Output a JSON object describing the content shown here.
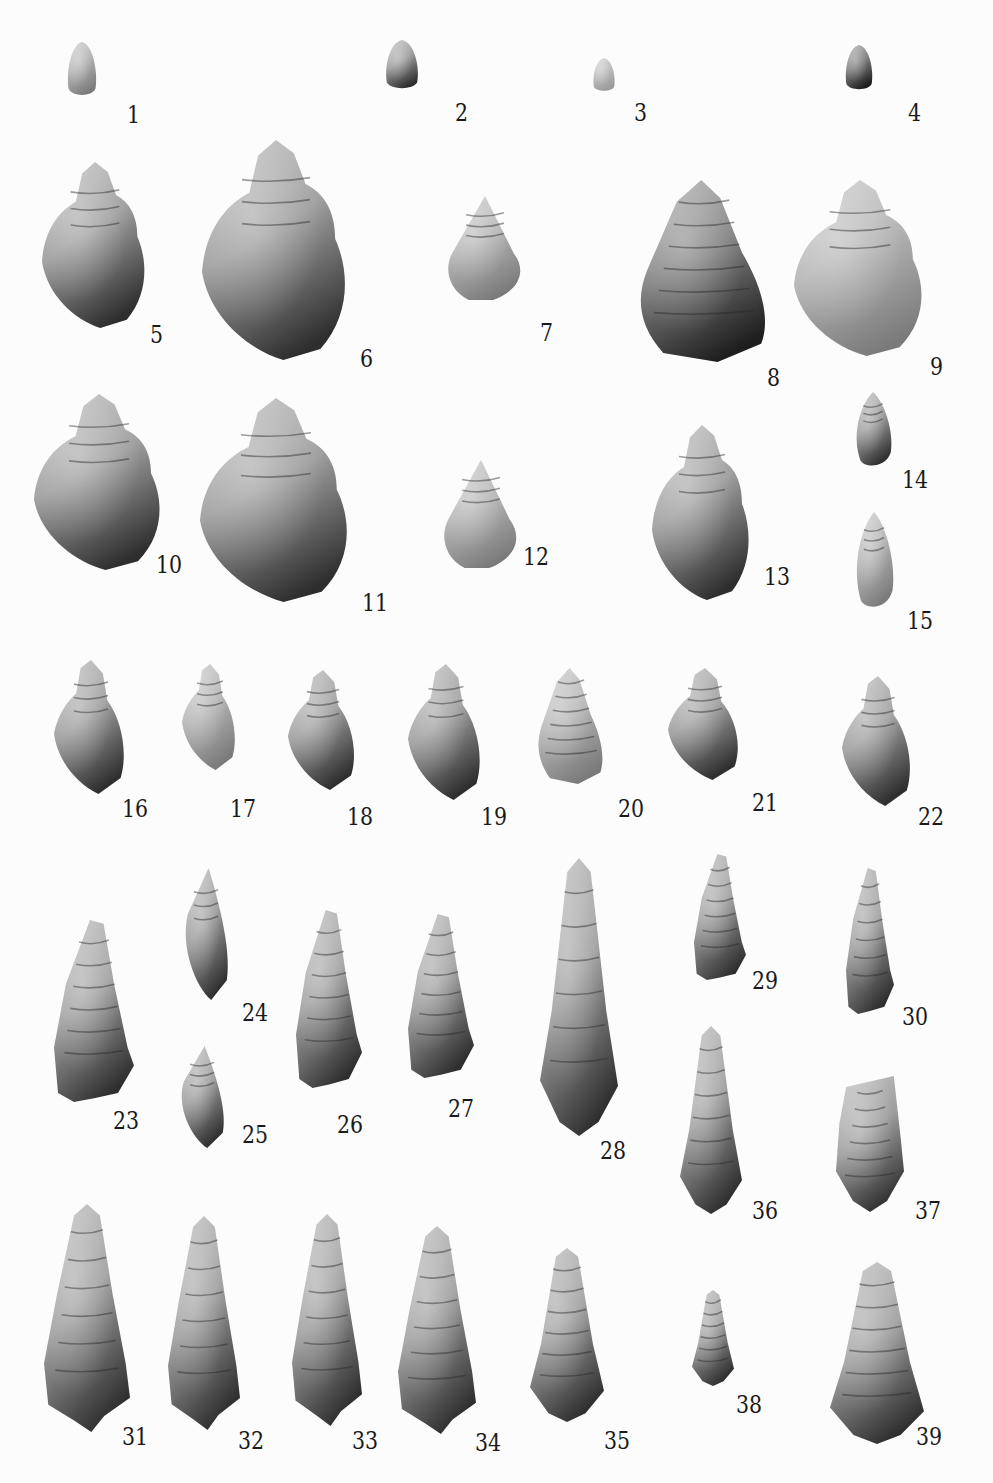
{
  "plate": {
    "background": "#fcfcfc",
    "label_color": "#1a1a1a",
    "figures": [
      {
        "id": "1",
        "label": "1",
        "shape": "egg",
        "x": 66,
        "y": 42,
        "w": 32,
        "h": 55,
        "lx": 127,
        "ly": 102,
        "tone": "light"
      },
      {
        "id": "2",
        "label": "2",
        "shape": "egg",
        "x": 384,
        "y": 40,
        "w": 36,
        "h": 50,
        "lx": 455,
        "ly": 100,
        "tone": "mid"
      },
      {
        "id": "3",
        "label": "3",
        "shape": "egg",
        "x": 592,
        "y": 58,
        "w": 24,
        "h": 34,
        "lx": 634,
        "ly": 100,
        "tone": "pale"
      },
      {
        "id": "4",
        "label": "4",
        "shape": "egg",
        "x": 844,
        "y": 45,
        "w": 30,
        "h": 46,
        "lx": 908,
        "ly": 100,
        "tone": "dark"
      },
      {
        "id": "5",
        "label": "5",
        "shape": "bulbous",
        "x": 42,
        "y": 162,
        "w": 106,
        "h": 166,
        "lx": 150,
        "ly": 322,
        "tone": "mid"
      },
      {
        "id": "6",
        "label": "6",
        "shape": "bulbous",
        "x": 202,
        "y": 140,
        "w": 148,
        "h": 220,
        "lx": 360,
        "ly": 346,
        "tone": "mid"
      },
      {
        "id": "7",
        "label": "7",
        "shape": "trochoid",
        "x": 444,
        "y": 196,
        "w": 82,
        "h": 104,
        "lx": 540,
        "ly": 320,
        "tone": "light"
      },
      {
        "id": "8",
        "label": "8",
        "shape": "conical",
        "x": 636,
        "y": 180,
        "w": 136,
        "h": 182,
        "lx": 767,
        "ly": 365,
        "tone": "dark"
      },
      {
        "id": "9",
        "label": "9",
        "shape": "bulbous",
        "x": 794,
        "y": 180,
        "w": 132,
        "h": 176,
        "lx": 930,
        "ly": 354,
        "tone": "light"
      },
      {
        "id": "10",
        "label": "10",
        "shape": "bulbous",
        "x": 34,
        "y": 394,
        "w": 130,
        "h": 176,
        "lx": 156,
        "ly": 552,
        "tone": "mid"
      },
      {
        "id": "11",
        "label": "11",
        "shape": "bulbous",
        "x": 200,
        "y": 398,
        "w": 152,
        "h": 204,
        "lx": 362,
        "ly": 590,
        "tone": "mid"
      },
      {
        "id": "12",
        "label": "12",
        "shape": "trochoid",
        "x": 440,
        "y": 460,
        "w": 82,
        "h": 108,
        "lx": 523,
        "ly": 544,
        "tone": "light"
      },
      {
        "id": "13",
        "label": "13",
        "shape": "bulbous",
        "x": 652,
        "y": 425,
        "w": 100,
        "h": 175,
        "lx": 764,
        "ly": 564,
        "tone": "mid"
      },
      {
        "id": "14",
        "label": "14",
        "shape": "slender",
        "x": 852,
        "y": 392,
        "w": 42,
        "h": 76,
        "lx": 902,
        "ly": 467,
        "tone": "mid"
      },
      {
        "id": "15",
        "label": "15",
        "shape": "slender",
        "x": 852,
        "y": 512,
        "w": 44,
        "h": 98,
        "lx": 907,
        "ly": 608,
        "tone": "light"
      },
      {
        "id": "16",
        "label": "16",
        "shape": "fusiform",
        "x": 54,
        "y": 660,
        "w": 74,
        "h": 134,
        "lx": 122,
        "ly": 796,
        "tone": "mid"
      },
      {
        "id": "17",
        "label": "17",
        "shape": "fusiform",
        "x": 182,
        "y": 664,
        "w": 56,
        "h": 106,
        "lx": 230,
        "ly": 796,
        "tone": "light"
      },
      {
        "id": "18",
        "label": "18",
        "shape": "fusiform",
        "x": 288,
        "y": 670,
        "w": 70,
        "h": 120,
        "lx": 347,
        "ly": 804,
        "tone": "mid"
      },
      {
        "id": "19",
        "label": "19",
        "shape": "fusiform",
        "x": 408,
        "y": 664,
        "w": 76,
        "h": 136,
        "lx": 481,
        "ly": 804,
        "tone": "mid"
      },
      {
        "id": "20",
        "label": "20",
        "shape": "conical",
        "x": 536,
        "y": 668,
        "w": 70,
        "h": 116,
        "lx": 618,
        "ly": 796,
        "tone": "light"
      },
      {
        "id": "21",
        "label": "21",
        "shape": "fusiform",
        "x": 668,
        "y": 668,
        "w": 74,
        "h": 112,
        "lx": 752,
        "ly": 790,
        "tone": "mid"
      },
      {
        "id": "22",
        "label": "22",
        "shape": "fusiform",
        "x": 842,
        "y": 676,
        "w": 72,
        "h": 130,
        "lx": 918,
        "ly": 804,
        "tone": "mid"
      },
      {
        "id": "23",
        "label": "23",
        "shape": "turritella",
        "x": 54,
        "y": 920,
        "w": 80,
        "h": 182,
        "lx": 113,
        "ly": 1108,
        "tone": "mid"
      },
      {
        "id": "24",
        "label": "24",
        "shape": "spindle",
        "x": 180,
        "y": 868,
        "w": 52,
        "h": 132,
        "lx": 242,
        "ly": 1000,
        "tone": "mid"
      },
      {
        "id": "25",
        "label": "25",
        "shape": "spindle",
        "x": 176,
        "y": 1046,
        "w": 52,
        "h": 102,
        "lx": 242,
        "ly": 1122,
        "tone": "mid"
      },
      {
        "id": "26",
        "label": "26",
        "shape": "turritella",
        "x": 296,
        "y": 910,
        "w": 66,
        "h": 178,
        "lx": 337,
        "ly": 1112,
        "tone": "mid"
      },
      {
        "id": "27",
        "label": "27",
        "shape": "turritella",
        "x": 408,
        "y": 914,
        "w": 66,
        "h": 164,
        "lx": 448,
        "ly": 1096,
        "tone": "mid"
      },
      {
        "id": "28",
        "label": "28",
        "shape": "longcone",
        "x": 540,
        "y": 858,
        "w": 78,
        "h": 278,
        "lx": 600,
        "ly": 1138,
        "tone": "mid"
      },
      {
        "id": "29",
        "label": "29",
        "shape": "turritella",
        "x": 694,
        "y": 854,
        "w": 52,
        "h": 126,
        "lx": 752,
        "ly": 968,
        "tone": "mid"
      },
      {
        "id": "30",
        "label": "30",
        "shape": "turritella",
        "x": 846,
        "y": 868,
        "w": 48,
        "h": 146,
        "lx": 902,
        "ly": 1004,
        "tone": "mid"
      },
      {
        "id": "31",
        "label": "31",
        "shape": "cerithium",
        "x": 44,
        "y": 1204,
        "w": 86,
        "h": 228,
        "lx": 122,
        "ly": 1424,
        "tone": "mid"
      },
      {
        "id": "32",
        "label": "32",
        "shape": "cerithium",
        "x": 168,
        "y": 1216,
        "w": 72,
        "h": 214,
        "lx": 238,
        "ly": 1428,
        "tone": "mid"
      },
      {
        "id": "33",
        "label": "33",
        "shape": "cerithium",
        "x": 292,
        "y": 1214,
        "w": 70,
        "h": 212,
        "lx": 352,
        "ly": 1428,
        "tone": "mid"
      },
      {
        "id": "34",
        "label": "34",
        "shape": "cerithium",
        "x": 398,
        "y": 1226,
        "w": 78,
        "h": 208,
        "lx": 475,
        "ly": 1430,
        "tone": "mid"
      },
      {
        "id": "35",
        "label": "35",
        "shape": "longcone",
        "x": 530,
        "y": 1248,
        "w": 74,
        "h": 174,
        "lx": 604,
        "ly": 1428,
        "tone": "mid"
      },
      {
        "id": "36",
        "label": "36",
        "shape": "longcone",
        "x": 680,
        "y": 1026,
        "w": 62,
        "h": 188,
        "lx": 752,
        "ly": 1198,
        "tone": "mid"
      },
      {
        "id": "37",
        "label": "37",
        "shape": "cylinder",
        "x": 836,
        "y": 1076,
        "w": 68,
        "h": 136,
        "lx": 915,
        "ly": 1198,
        "tone": "mid"
      },
      {
        "id": "38",
        "label": "38",
        "shape": "longcone",
        "x": 692,
        "y": 1290,
        "w": 42,
        "h": 96,
        "lx": 736,
        "ly": 1392,
        "tone": "mid"
      },
      {
        "id": "39",
        "label": "39",
        "shape": "longcone",
        "x": 830,
        "y": 1262,
        "w": 94,
        "h": 182,
        "lx": 916,
        "ly": 1424,
        "tone": "mid"
      }
    ]
  },
  "tones": {
    "pale": {
      "top": "#d9d9d9",
      "mid": "#bdbdbd",
      "bot": "#9a9a9a"
    },
    "light": {
      "top": "#d2d2d2",
      "mid": "#b4b4b4",
      "bot": "#7a7a7a"
    },
    "mid": {
      "top": "#c6c6c6",
      "mid": "#9e9e9e",
      "bot": "#2e2e2e"
    },
    "dark": {
      "top": "#b8b8b8",
      "mid": "#7e7e7e",
      "bot": "#1e1e1e"
    }
  }
}
